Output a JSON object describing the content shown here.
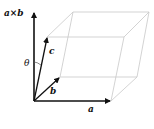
{
  "diagram": {
    "labels": {
      "cross": "a×b",
      "theta": "θ",
      "a": "a",
      "b": "b",
      "c": "c"
    },
    "colors": {
      "vector": "#111111",
      "box_edge": "#c8c8c8",
      "background": "#ffffff"
    },
    "points": {
      "origin": [
        34,
        101
      ],
      "a_end": [
        111,
        101
      ],
      "b_end": [
        60,
        77
      ],
      "c_end": [
        47,
        37
      ],
      "cross_end": [
        34,
        12
      ]
    }
  }
}
